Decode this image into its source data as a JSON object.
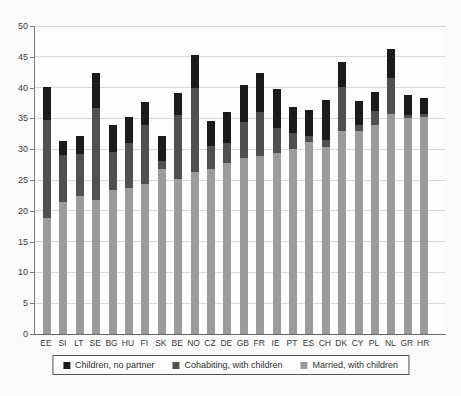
{
  "chart_data": {
    "type": "bar",
    "stacked": true,
    "title": "",
    "xlabel": "",
    "ylabel": "",
    "categories": [
      "EE",
      "SI",
      "LT",
      "SE",
      "BG",
      "HU",
      "FI",
      "SK",
      "BE",
      "NO",
      "CZ",
      "DE",
      "GB",
      "FR",
      "IE",
      "PT",
      "ES",
      "CH",
      "DK",
      "CY",
      "PL",
      "NL",
      "GR",
      "HR"
    ],
    "series": [
      {
        "name": "Married, with children",
        "color": "#9b9b9b",
        "values": [
          18.8,
          21.4,
          22.4,
          21.7,
          23.3,
          23.7,
          24.3,
          26.8,
          25.2,
          26.3,
          26.8,
          27.8,
          28.5,
          28.9,
          29.4,
          30.0,
          31.2,
          30.4,
          33.0,
          33.0,
          34.0,
          35.7,
          35.1,
          35.2
        ]
      },
      {
        "name": "Cohabiting, with children",
        "color": "#505050",
        "values": [
          16.0,
          7.7,
          6.9,
          15.0,
          6.2,
          7.3,
          9.7,
          1.3,
          10.4,
          13.6,
          3.7,
          3.2,
          5.9,
          7.2,
          4.0,
          2.7,
          1.0,
          1.1,
          7.1,
          1.0,
          2.2,
          5.8,
          0.5,
          0.5
        ]
      },
      {
        "name": "Children, no partner",
        "color": "#1b1b1b",
        "values": [
          5.3,
          2.3,
          2.8,
          5.6,
          4.5,
          4.3,
          3.6,
          4.0,
          3.5,
          5.4,
          4.1,
          5.0,
          6.1,
          6.2,
          6.4,
          4.1,
          4.1,
          6.5,
          4.1,
          3.8,
          3.1,
          4.7,
          3.2,
          2.6
        ]
      }
    ],
    "totals": [
      40.1,
      31.4,
      32.1,
      42.3,
      34.0,
      35.3,
      37.6,
      32.1,
      39.1,
      45.3,
      34.6,
      36.0,
      40.5,
      42.3,
      39.8,
      36.8,
      36.3,
      38.0,
      44.2,
      37.8,
      39.3,
      46.2,
      38.8,
      38.3
    ],
    "legend": [
      {
        "label": "Children, no partner",
        "color": "#1b1b1b"
      },
      {
        "label": "Cohabiting, with children",
        "color": "#505050"
      },
      {
        "label": "Married, with children",
        "color": "#9b9b9b"
      }
    ],
    "legend_position": "bottom",
    "grid": true,
    "y_axis": {
      "min": 0,
      "max": 50,
      "step": 5,
      "ticks": [
        "0",
        "5",
        "10",
        "15",
        "20",
        "25",
        "30",
        "35",
        "40",
        "45",
        "50"
      ]
    }
  }
}
